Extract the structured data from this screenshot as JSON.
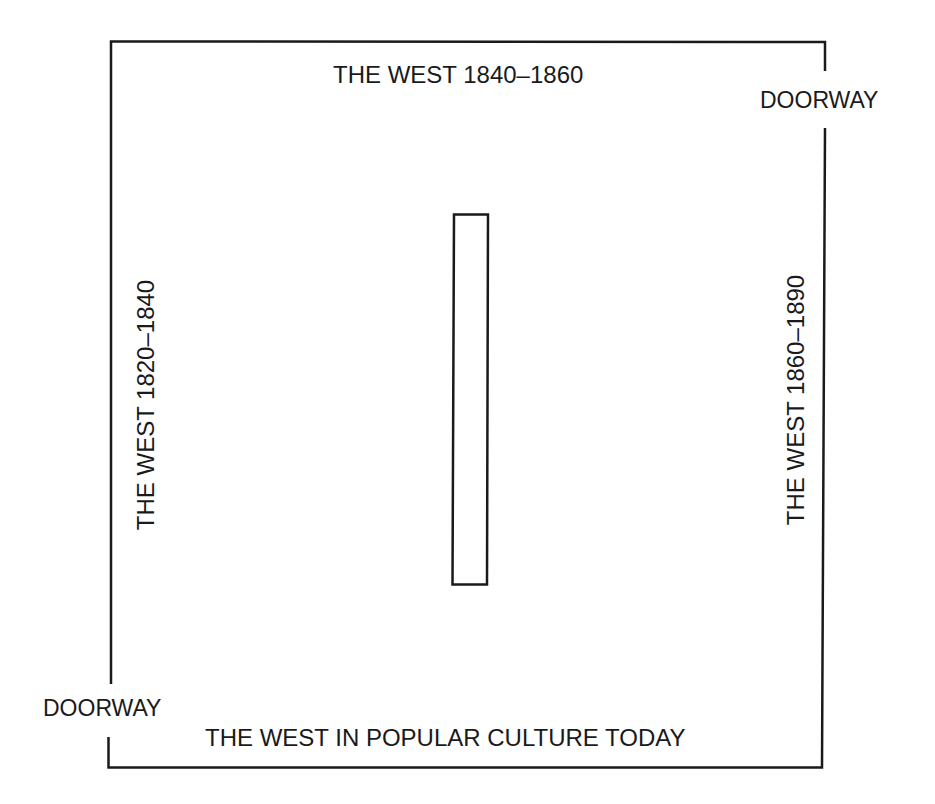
{
  "diagram": {
    "type": "floor-plan",
    "room": {
      "walls": {
        "top": "THE WEST 1840–1860",
        "left": "THE WEST 1820–1840",
        "right": "THE WEST 1860–1890",
        "bottom": "THE WEST IN POPULAR CULTURE TODAY"
      },
      "doorways": [
        {
          "position": "upper-right",
          "label": "DOORWAY"
        },
        {
          "position": "lower-left",
          "label": "DOORWAY"
        }
      ],
      "center_partition": {
        "shape": "rectangle",
        "label": ""
      }
    },
    "colors": {
      "line": "#1a1a1a",
      "background": "#ffffff"
    }
  }
}
